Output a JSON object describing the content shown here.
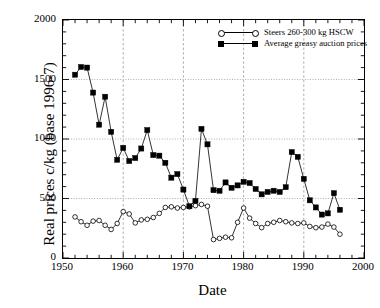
{
  "chart_data": {
    "type": "line",
    "title": "",
    "xlabel": "Date",
    "ylabel": "Real prices c/kg (base 1996-7)",
    "xlim": [
      1950,
      2000
    ],
    "ylim": [
      0,
      2000
    ],
    "xticks": [
      1950,
      1960,
      1970,
      1980,
      1990,
      2000
    ],
    "yticks": [
      0,
      500,
      1000,
      1500,
      2000
    ],
    "x_minor_tick_interval": 2,
    "y_minor_tick_interval": 100,
    "grid": "horizontal dotted gray at y-major ticks; vertical dashed gray at x-major ticks",
    "legend_position": "top-right inside axes",
    "series": [
      {
        "name": "Steers 260-300 kg HSCW",
        "marker": "open-circle",
        "color": "#000000",
        "x": [
          1952,
          1953,
          1954,
          1955,
          1956,
          1957,
          1958,
          1959,
          1960,
          1961,
          1962,
          1963,
          1964,
          1965,
          1966,
          1967,
          1968,
          1969,
          1970,
          1971,
          1972,
          1973,
          1974,
          1975,
          1976,
          1977,
          1978,
          1979,
          1980,
          1981,
          1982,
          1983,
          1984,
          1985,
          1986,
          1987,
          1988,
          1989,
          1990,
          1991,
          1992,
          1993,
          1994,
          1995,
          1996
        ],
        "y": [
          345,
          305,
          275,
          310,
          315,
          275,
          240,
          290,
          390,
          370,
          295,
          320,
          325,
          340,
          375,
          425,
          430,
          420,
          425,
          430,
          440,
          450,
          435,
          155,
          165,
          175,
          170,
          300,
          420,
          335,
          290,
          255,
          290,
          300,
          315,
          305,
          295,
          290,
          295,
          265,
          255,
          260,
          285,
          260,
          200
        ]
      },
      {
        "name": "Average greasy auction prices",
        "marker": "filled-square",
        "color": "#000000",
        "x": [
          1952,
          1953,
          1954,
          1955,
          1956,
          1957,
          1958,
          1959,
          1960,
          1961,
          1962,
          1963,
          1964,
          1965,
          1966,
          1967,
          1968,
          1969,
          1970,
          1971,
          1972,
          1973,
          1974,
          1975,
          1976,
          1977,
          1978,
          1979,
          1980,
          1981,
          1982,
          1983,
          1984,
          1985,
          1986,
          1987,
          1988,
          1989,
          1990,
          1991,
          1992,
          1993,
          1994,
          1995,
          1996
        ],
        "y": [
          1540,
          1605,
          1600,
          1390,
          1120,
          1355,
          1060,
          825,
          925,
          815,
          840,
          920,
          1075,
          865,
          860,
          800,
          675,
          705,
          575,
          435,
          480,
          1085,
          955,
          570,
          565,
          635,
          590,
          610,
          640,
          630,
          580,
          535,
          555,
          565,
          555,
          595,
          890,
          850,
          665,
          485,
          425,
          365,
          375,
          545,
          405
        ]
      }
    ]
  },
  "axis": {
    "ylabel": "Real prices c/kg (base 1996-7)",
    "xlabel": "Date",
    "ytick_labels": [
      "2000",
      "1500",
      "1000",
      "500",
      "0"
    ],
    "xtick_labels": [
      "1950",
      "1960",
      "1970",
      "1980",
      "1990",
      "2000"
    ]
  },
  "legend": {
    "entries": [
      {
        "label": "Steers 260-300 kg HSCW",
        "marker": "open-circle"
      },
      {
        "label": "Average greasy auction prices",
        "marker": "filled-square"
      }
    ]
  },
  "colors": {
    "foreground": "#000000",
    "background": "#ffffff",
    "gridline": "#999999"
  }
}
